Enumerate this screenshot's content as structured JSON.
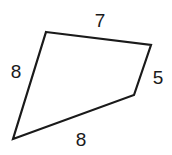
{
  "figure": {
    "type": "quadrilateral-diagram",
    "background_color": "#ffffff",
    "stroke_color": "#1a1a1a",
    "fill_color": "#ffffff",
    "stroke_width": 2.2,
    "canvas": {
      "width": 172,
      "height": 155
    },
    "vertices": [
      {
        "name": "top-left",
        "x": 46,
        "y": 32
      },
      {
        "name": "top-right",
        "x": 151,
        "y": 45
      },
      {
        "name": "bottom-right",
        "x": 134,
        "y": 95
      },
      {
        "name": "bottom-left",
        "x": 13,
        "y": 139
      }
    ],
    "polygon_points": "46,32 151,45 134,95 13,139",
    "side_labels": [
      {
        "id": "top",
        "value": "7",
        "x": 100,
        "y": 20,
        "edge": "top-left to top-right"
      },
      {
        "id": "right",
        "value": "5",
        "x": 158,
        "y": 77,
        "edge": "top-right to bottom-right"
      },
      {
        "id": "bottom",
        "value": "8",
        "x": 81,
        "y": 139,
        "edge": "bottom-right to bottom-left"
      },
      {
        "id": "left",
        "value": "8",
        "x": 16,
        "y": 71,
        "edge": "bottom-left to top-left"
      }
    ]
  }
}
